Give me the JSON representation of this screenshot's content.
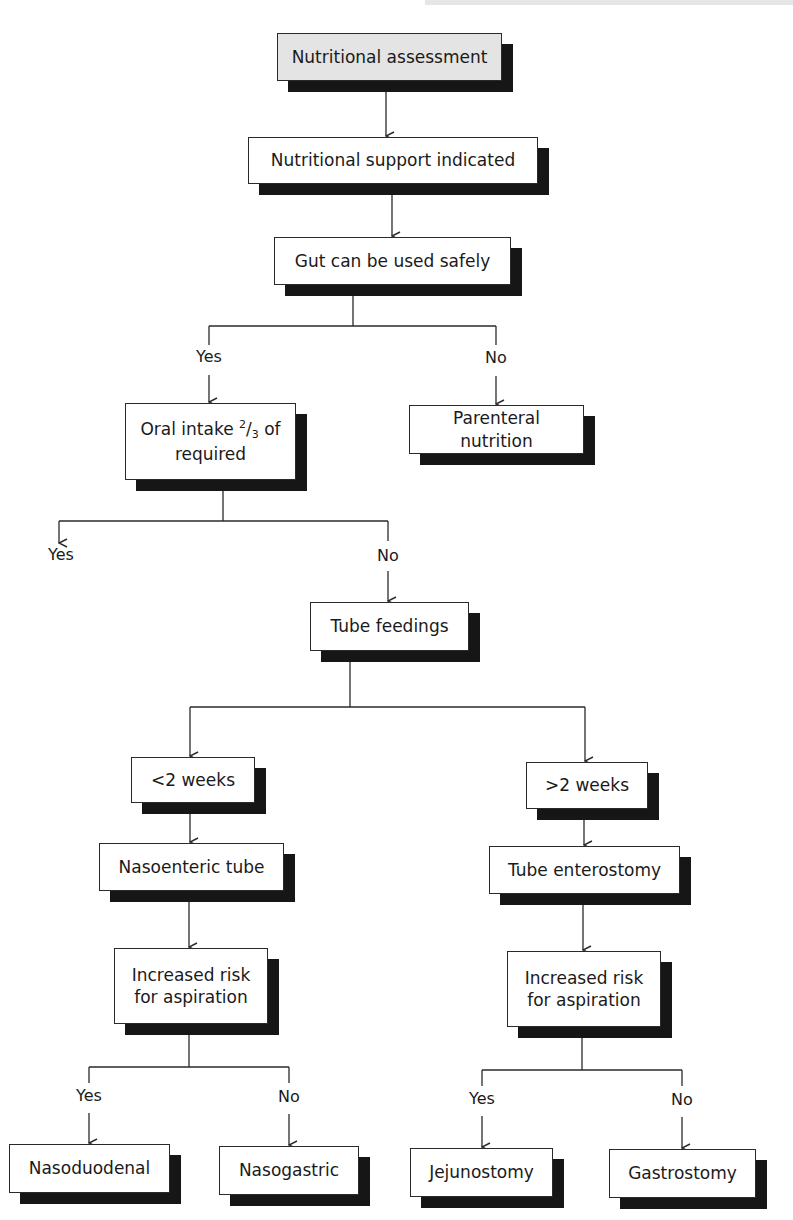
{
  "flowchart": {
    "nodes": {
      "assessment": "Nutritional assessment",
      "support": "Nutritional support indicated",
      "gut": "Gut can be used safely",
      "oral_pre": "Oral intake ",
      "oral_num": "2",
      "oral_slash": "/",
      "oral_den": "3",
      "oral_post": " of required",
      "parenteral": "Parenteral nutrition",
      "tube": "Tube feedings",
      "lt2": "<2 weeks",
      "gt2": ">2 weeks",
      "nasoenteric": "Nasoenteric tube",
      "enterostomy": "Tube enterostomy",
      "risk_left": "Increased risk for aspiration",
      "risk_right": "Increased risk for aspiration",
      "nasoduodenal": "Nasoduodenal",
      "nasogastric": "Nasogastric",
      "jejunostomy": "Jejunostomy",
      "gastrostomy": "Gastrostomy"
    },
    "labels": {
      "gut_yes": "Yes",
      "gut_no": "No",
      "oral_yes": "Yes",
      "oral_no": "No",
      "riskl_yes": "Yes",
      "riskl_no": "No",
      "riskr_yes": "Yes",
      "riskr_no": "No"
    },
    "edges": [
      [
        "Nutritional assessment",
        "Nutritional support indicated"
      ],
      [
        "Nutritional support indicated",
        "Gut can be used safely"
      ],
      [
        "Gut can be used safely",
        "Oral intake 2/3 of required",
        "Yes"
      ],
      [
        "Gut can be used safely",
        "Parenteral nutrition",
        "No"
      ],
      [
        "Oral intake 2/3 of required",
        "(end)",
        "Yes"
      ],
      [
        "Oral intake 2/3 of required",
        "Tube feedings",
        "No"
      ],
      [
        "Tube feedings",
        "<2 weeks"
      ],
      [
        "Tube feedings",
        ">2 weeks"
      ],
      [
        "<2 weeks",
        "Nasoenteric tube"
      ],
      [
        ">2 weeks",
        "Tube enterostomy"
      ],
      [
        "Nasoenteric tube",
        "Increased risk for aspiration"
      ],
      [
        "Tube enterostomy",
        "Increased risk for aspiration"
      ],
      [
        "Increased risk for aspiration (left)",
        "Nasoduodenal",
        "Yes"
      ],
      [
        "Increased risk for aspiration (left)",
        "Nasogastric",
        "No"
      ],
      [
        "Increased risk for aspiration (right)",
        "Jejunostomy",
        "Yes"
      ],
      [
        "Increased risk for aspiration (right)",
        "Gastrostomy",
        "No"
      ]
    ],
    "colors": {
      "start_fill": "#e4e4e4",
      "box_fill": "#ffffff",
      "shadow": "#161616",
      "line": "#2a2a2a"
    }
  }
}
